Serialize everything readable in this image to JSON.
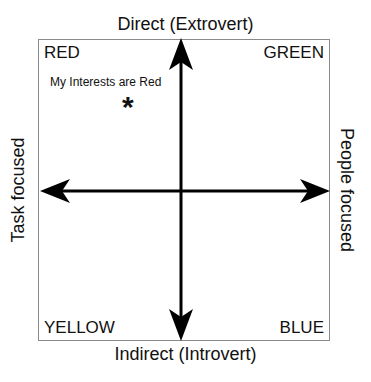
{
  "diagram": {
    "type": "quadrant",
    "axes": {
      "top": "Direct (Extrovert)",
      "bottom": "Indirect (Introvert)",
      "left": "Task focused",
      "right": "People focused"
    },
    "quadrants": {
      "top_left": "RED",
      "top_right": "GREEN",
      "bottom_left": "YELLOW",
      "bottom_right": "BLUE"
    },
    "annotation": {
      "text": "My Interests are Red",
      "marker": "*"
    }
  }
}
